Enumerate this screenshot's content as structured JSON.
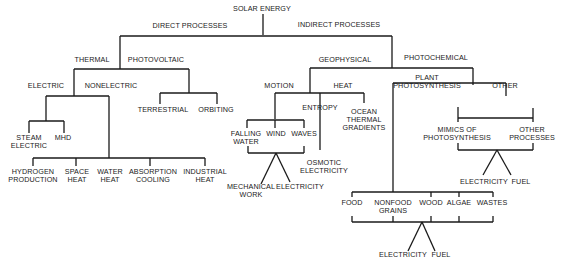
{
  "title": "SOLAR ENERGY",
  "labels": {
    "root": "SOLAR ENERGY",
    "direct": "DIRECT PROCESSES",
    "indirect": "INDIRECT PROCESSES",
    "thermal": "THERMAL",
    "photovoltaic": "PHOTOVOLTAIC",
    "electric": "ELECTRIC",
    "nonelectric": "NONELECTRIC",
    "terrestrial": "TERRESTRIAL",
    "orbiting": "ORBITING",
    "steam_electric": "STEAM\nELECTRIC",
    "mhd": "MHD",
    "hydrogen": "HYDROGEN\nPRODUCTION",
    "space_heat": "SPACE\nHEAT",
    "water_heat": "WATER\nHEAT",
    "absorption": "ABSORPTION\nCOOLING",
    "industrial": "INDUSTRIAL\nHEAT",
    "geophysical": "GEOPHYSICAL",
    "photochemical": "PHOTOCHEMICAL",
    "motion": "MOTION",
    "heat": "HEAT",
    "entropy": "ENTROPY",
    "ocean_thermal": "OCEAN\nTHERMAL\nGRADIENTS",
    "falling_water": "FALLING\nWATER",
    "wind": "WIND",
    "waves": "WAVES",
    "mechanical_work": "MECHANICAL\nWORK",
    "electricity_motion": "ELECTRICITY",
    "osmotic": "OSMOTIC\nELECTRICITY",
    "plant_photosynthesis": "PLANT\nPHOTOSYNTHESIS",
    "other": "OTHER",
    "mimics": "MIMICS OF\nPHOTOSYNTHESIS",
    "other_processes": "OTHER\nPROCESSES",
    "electricity_other": "ELECTRICITY",
    "fuel_other": "FUEL",
    "food": "FOOD",
    "nonfood": "NONFOOD\nGRAINS",
    "wood": "WOOD",
    "algae": "ALGAE",
    "wastes": "WASTES",
    "electricity_plant": "ELECTRICITY",
    "fuel_plant": "FUEL"
  }
}
